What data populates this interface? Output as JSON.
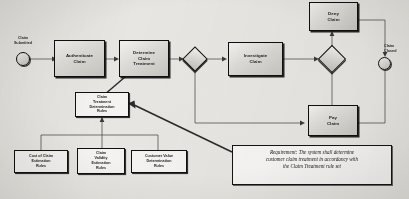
{
  "diagram": {
    "type": "bpmn-process-flow",
    "background_color": "#e8e6e2",
    "line_color": "#4a4a4a",
    "node_fill": "#dcdad6",
    "node_stroke": "#0f0f0f"
  },
  "events": [
    {
      "id": "start",
      "name": "start-event",
      "label": "Claim\nSubmitted",
      "label_line1": "Claim",
      "label_line2": "Submitted",
      "shape": "circle"
    },
    {
      "id": "end",
      "name": "end-event",
      "label": "Claim\nClosed",
      "label_line1": "Claim",
      "label_line2": "Closed",
      "shape": "circle"
    }
  ],
  "activities": [
    {
      "id": "authenticate",
      "label": "Authenticate\nClaim",
      "line1": "Authenticate",
      "line2": "Claim",
      "line3": ""
    },
    {
      "id": "determine",
      "label": "Determine\nClaim\nTreatment",
      "line1": "Determine",
      "line2": "Claim",
      "line3": "Treatment"
    },
    {
      "id": "investigate",
      "label": "Investigate\nClaim",
      "line1": "Investigate",
      "line2": "Claim",
      "line3": ""
    },
    {
      "id": "deny",
      "label": "Deny\nClaim",
      "line1": "Deny",
      "line2": "Claim",
      "line3": ""
    },
    {
      "id": "pay",
      "label": "Pay\nClaim",
      "line1": "Pay",
      "line2": "Claim",
      "line3": ""
    }
  ],
  "gateways": [
    {
      "id": "gateway1",
      "label": "",
      "shape": "diamond"
    },
    {
      "id": "gateway2",
      "label": "",
      "shape": "diamond"
    }
  ],
  "rules": {
    "parent": {
      "id": "claim-treatment-rules",
      "label": "Claim Treatment Determination Rules",
      "line1": "Claim",
      "line2": "Treatment",
      "line3": "Determination",
      "line4": "Rules"
    },
    "children": [
      {
        "id": "cost-of-claim-rules",
        "label": "Cost of Claim Estimation Rules",
        "line1": "Cost of Claim",
        "line2": "Estimation",
        "line3": "Rules"
      },
      {
        "id": "claim-validity-rules",
        "label": "Claim Validity Estimation Rules",
        "line1": "Claim",
        "line2": "Validity",
        "line3": "Estimation",
        "line4": "Rules"
      },
      {
        "id": "customer-value-rules",
        "label": "Customer Value Determination Rules",
        "line1": "Customer Value",
        "line2": "Determination",
        "line3": "Rules"
      }
    ]
  },
  "note": {
    "id": "requirement-note",
    "line1": "Requirement: The system shall determine",
    "line2": "customer claim treatment in accordancy with",
    "line3": "the Claim Treatment rule set",
    "full_text": "Requirement: The system shall determine customer claim treatment in accordancy with the Claim Treatment rule set"
  }
}
